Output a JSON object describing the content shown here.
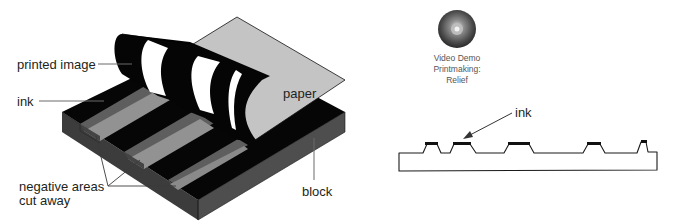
{
  "figure": {
    "colors": {
      "ink": "#050505",
      "block_side_dark": "#3a3a3a",
      "block_side_front": "#4d4d4d",
      "cut_floor": "#8f8f8f",
      "cut_wall": "#5f5f5f",
      "paper": "#c4c4c4",
      "leader_line": "#6b6b6b"
    }
  },
  "block_diagram": {
    "labels": {
      "printed_image": "printed image",
      "ink": "ink",
      "paper": "paper",
      "negative_line1": "negative areas",
      "negative_line2": "cut away",
      "block": "block"
    }
  },
  "video_demo": {
    "icon": "cd-disc-icon",
    "line1": "Video Demo",
    "line2": "Printmaking:",
    "line3": "Relief"
  },
  "cross_section": {
    "labels": {
      "ink": "ink"
    },
    "raised_areas": 5
  }
}
